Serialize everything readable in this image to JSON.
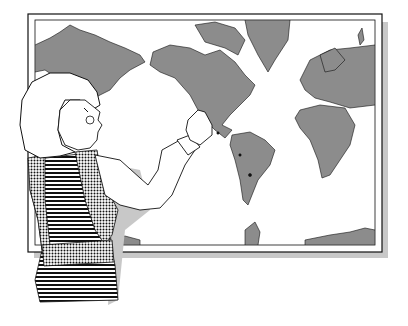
{
  "illustration": {
    "subject": "Girl pointing at a world map",
    "colors": {
      "land": "#8c8c8c",
      "ocean": "#ffffff",
      "line": "#111111",
      "shadow": "#c8c8c8",
      "skin": "#ffffff"
    },
    "map": {
      "projection": "world map",
      "regions": [
        "North America",
        "South America",
        "Europe",
        "Africa",
        "Asia",
        "Greenland",
        "Antarctica"
      ]
    }
  }
}
